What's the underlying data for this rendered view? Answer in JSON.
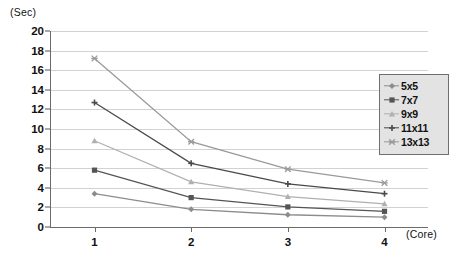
{
  "chart_data": {
    "type": "line",
    "title": "",
    "xlabel": "(Core)",
    "ylabel": "(Sec)",
    "x": [
      1,
      2,
      3,
      4
    ],
    "categories": [
      "1",
      "2",
      "3",
      "4"
    ],
    "xlim": [
      0.55,
      4.45
    ],
    "ylim": [
      0,
      20
    ],
    "y_ticks": [
      0,
      2,
      4,
      6,
      8,
      10,
      12,
      14,
      16,
      18,
      20
    ],
    "x_ticks": [
      "1",
      "2",
      "3",
      "4"
    ],
    "grid": "horizontal",
    "legend_position": "right",
    "series": [
      {
        "name": "5x5",
        "values": [
          3.4,
          1.8,
          1.25,
          1.0
        ],
        "color": "#8c8c8c",
        "marker": "diamond"
      },
      {
        "name": "7x7",
        "values": [
          5.8,
          3.0,
          2.05,
          1.6
        ],
        "color": "#555555",
        "marker": "square"
      },
      {
        "name": "9x9",
        "values": [
          8.8,
          4.6,
          3.1,
          2.35
        ],
        "color": "#b0b0b0",
        "marker": "triangle"
      },
      {
        "name": "11x11",
        "values": [
          12.7,
          6.5,
          4.4,
          3.4
        ],
        "color": "#4a4a4a",
        "marker": "cross"
      },
      {
        "name": "13x13",
        "values": [
          17.2,
          8.7,
          5.9,
          4.5
        ],
        "color": "#9a9a9a",
        "marker": "star"
      }
    ]
  },
  "axes": {
    "y_unit": "(Sec)",
    "x_unit": "(Core)"
  }
}
